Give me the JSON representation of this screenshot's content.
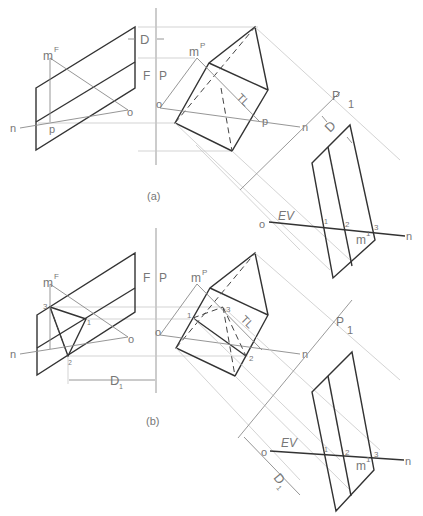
{
  "figure": {
    "panels": [
      {
        "id": "a",
        "caption": "(a)",
        "labels": {
          "front_point_m": "m",
          "front_sup": "F",
          "profile_point_m": "m",
          "profile_sup": "P",
          "point_o_front": "o",
          "point_n_front": "n",
          "point_p_front": "p",
          "point_o_profile": "o",
          "point_n_profile": "n",
          "point_p_profile": "p",
          "fold_line_F": "F",
          "fold_line_P": "P",
          "distance": "D",
          "true_length": "TL",
          "aux_P": "P",
          "aux_1": "1",
          "aux_distance": "D",
          "edge_view": "EV",
          "aux_o": "o",
          "aux_n": "n",
          "aux_m": "m",
          "aux_m_sup": "1",
          "pt1": "1",
          "pt2": "2",
          "pt3": "3"
        }
      },
      {
        "id": "b",
        "caption": "(b)",
        "labels": {
          "front_point_m": "m",
          "front_sup": "F",
          "profile_point_m": "m",
          "profile_sup": "P",
          "point_o_front": "o",
          "point_n_front": "n",
          "point_o_profile": "o",
          "point_n_profile": "n",
          "fold_line_F": "F",
          "fold_line_P": "P",
          "distance": "D",
          "distance_sub": "1",
          "true_length": "TL",
          "aux_P": "P",
          "aux_1": "1",
          "aux_distance": "D",
          "aux_distance_sub": "1",
          "edge_view": "EV",
          "aux_o": "o",
          "aux_n": "n",
          "aux_m": "m",
          "aux_m_sup": "1",
          "front_pt1": "1",
          "front_pt2": "2",
          "front_pt3": "3",
          "profile_pt1": "1",
          "profile_pt2": "2",
          "profile_pt3": "3",
          "pt1": "1",
          "pt2": "2",
          "pt3": "3"
        }
      }
    ]
  }
}
